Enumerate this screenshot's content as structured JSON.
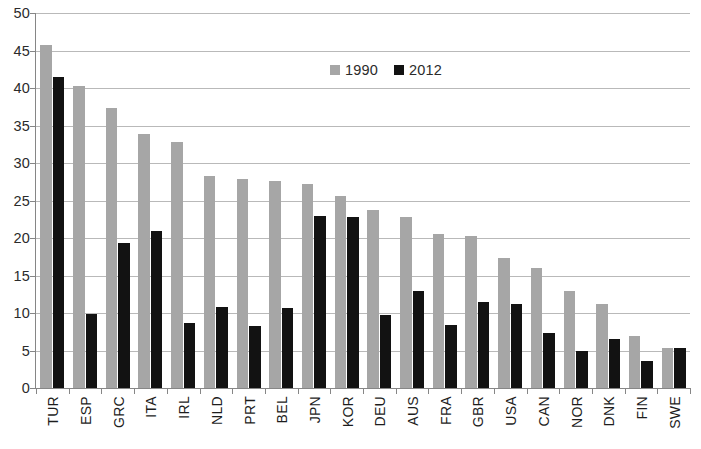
{
  "chart_data": {
    "type": "bar",
    "title": "",
    "xlabel": "",
    "ylabel": "",
    "ylim": [
      0,
      50
    ],
    "ytick_step": 5,
    "yticks": [
      0,
      5,
      10,
      15,
      20,
      25,
      30,
      35,
      40,
      45,
      50
    ],
    "grid": true,
    "legend_position": "top-center",
    "categories": [
      "TUR",
      "ESP",
      "GRC",
      "ITA",
      "IRL",
      "NLD",
      "PRT",
      "BEL",
      "JPN",
      "KOR",
      "DEU",
      "AUS",
      "FRA",
      "GBR",
      "USA",
      "CAN",
      "NOR",
      "DNK",
      "FIN",
      "SWE"
    ],
    "series": [
      {
        "name": "1990",
        "color": "#a6a6a6",
        "values": [
          45.7,
          40.3,
          37.3,
          33.9,
          32.8,
          28.3,
          27.9,
          27.6,
          27.2,
          25.6,
          23.8,
          22.8,
          20.5,
          20.3,
          17.4,
          16.0,
          12.9,
          11.2,
          7.0,
          5.4
        ]
      },
      {
        "name": "2012",
        "color": "#121212",
        "values": [
          41.5,
          9.9,
          19.3,
          20.9,
          8.7,
          10.8,
          8.3,
          10.7,
          23.0,
          22.8,
          9.8,
          13.0,
          8.4,
          11.5,
          11.2,
          7.4,
          5.0,
          6.5,
          3.6,
          5.3
        ]
      }
    ]
  }
}
